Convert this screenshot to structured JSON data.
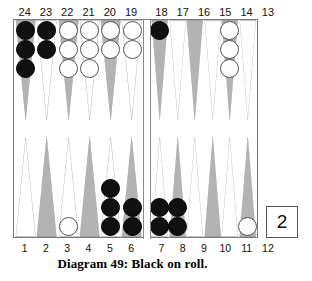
{
  "caption": "Diagram 49:  Black on roll.",
  "cube": {
    "value": "2"
  },
  "top_numbers": [
    "24",
    "23",
    "22",
    "21",
    "20",
    "19",
    "18",
    "17",
    "16",
    "15",
    "14",
    "13"
  ],
  "bottom_numbers": [
    "1",
    "2",
    "3",
    "4",
    "5",
    "6",
    "7",
    "8",
    "9",
    "10",
    "11",
    "12"
  ],
  "colors": {
    "black_checker": "#101010",
    "white_checker": "#fdfdfd",
    "point_shaded": "#b3b3b3",
    "point_light": "#ffffff",
    "point_outline": "#8a8a8a",
    "board_border": "#7a7a7a"
  },
  "chart_data": {
    "type": "table",
    "title": "Diagram 49:  Black on roll.",
    "xlabel": "Point number",
    "ylabel": "Checkers on point",
    "categories": [
      "24",
      "23",
      "22",
      "21",
      "20",
      "19",
      "18",
      "17",
      "16",
      "15",
      "14",
      "13",
      "12",
      "11",
      "10",
      "9",
      "8",
      "7",
      "6",
      "5",
      "4",
      "3",
      "2",
      "1"
    ],
    "series": [
      {
        "name": "Black",
        "values": [
          3,
          2,
          0,
          0,
          0,
          0,
          1,
          0,
          0,
          0,
          0,
          0,
          0,
          0,
          0,
          0,
          2,
          2,
          2,
          3,
          0,
          0,
          0,
          0
        ]
      },
      {
        "name": "White",
        "values": [
          0,
          0,
          3,
          3,
          2,
          2,
          0,
          0,
          0,
          0,
          3,
          0,
          1,
          0,
          0,
          0,
          0,
          0,
          0,
          0,
          0,
          1,
          0,
          0
        ]
      }
    ],
    "legend": [
      "Black",
      "White"
    ],
    "annotations": [
      "Cube value 2",
      "Black on roll",
      "Black total 15",
      "White total 15"
    ]
  },
  "board": {
    "top_left": [
      {
        "point": "24",
        "shade": "shaded",
        "color": "black",
        "count": 3
      },
      {
        "point": "23",
        "shade": "light",
        "color": "black",
        "count": 2
      },
      {
        "point": "22",
        "shade": "shaded",
        "color": "white",
        "count": 3
      },
      {
        "point": "21",
        "shade": "light",
        "color": "white",
        "count": 3
      },
      {
        "point": "20",
        "shade": "shaded",
        "color": "white",
        "count": 2
      },
      {
        "point": "19",
        "shade": "light",
        "color": "white",
        "count": 2
      }
    ],
    "top_right": [
      {
        "point": "18",
        "shade": "shaded",
        "color": "black",
        "count": 1
      },
      {
        "point": "17",
        "shade": "light",
        "color": "none",
        "count": 0
      },
      {
        "point": "16",
        "shade": "shaded",
        "color": "none",
        "count": 0
      },
      {
        "point": "15",
        "shade": "light",
        "color": "none",
        "count": 0
      },
      {
        "point": "14",
        "shade": "shaded",
        "color": "white",
        "count": 3
      },
      {
        "point": "13",
        "shade": "light",
        "color": "none",
        "count": 0
      }
    ],
    "bottom_left": [
      {
        "point": "1",
        "shade": "light",
        "color": "none",
        "count": 0
      },
      {
        "point": "2",
        "shade": "shaded",
        "color": "none",
        "count": 0
      },
      {
        "point": "3",
        "shade": "light",
        "color": "white",
        "count": 1
      },
      {
        "point": "4",
        "shade": "shaded",
        "color": "none",
        "count": 0
      },
      {
        "point": "5",
        "shade": "light",
        "color": "black",
        "count": 3
      },
      {
        "point": "6",
        "shade": "shaded",
        "color": "black",
        "count": 2
      }
    ],
    "bottom_right": [
      {
        "point": "7",
        "shade": "light",
        "color": "black",
        "count": 2
      },
      {
        "point": "8",
        "shade": "shaded",
        "color": "black",
        "count": 2
      },
      {
        "point": "9",
        "shade": "light",
        "color": "none",
        "count": 0
      },
      {
        "point": "10",
        "shade": "shaded",
        "color": "none",
        "count": 0
      },
      {
        "point": "11",
        "shade": "light",
        "color": "none",
        "count": 0
      },
      {
        "point": "12",
        "shade": "shaded",
        "color": "white",
        "count": 1
      }
    ]
  }
}
